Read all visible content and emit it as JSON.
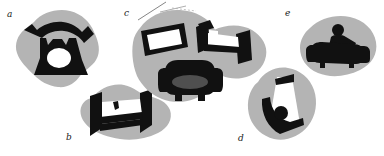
{
  "figure": {
    "type": "line-drawing-silhouette-diagram",
    "background_color": "#ffffff",
    "blob_color": "#b4b4b4",
    "silhouette_color": "#111111",
    "cushion_color": "#4f4f4f",
    "hole_color": "#ffffff",
    "width": 384,
    "height": 156
  },
  "panels": [
    {
      "id": "a",
      "label": "a",
      "label_x": 7,
      "label_y": 10,
      "object": "rotary-telephone",
      "object_count": 1,
      "has_blob": true
    },
    {
      "id": "b",
      "label": "b",
      "label_x": 66,
      "label_y": 133,
      "object": "bed",
      "object_count": 1,
      "has_blob": true
    },
    {
      "id": "c",
      "label": "c",
      "label_x": 124,
      "label_y": 9,
      "object": "picture-frame-bed-armchair-group",
      "object_count": 3,
      "has_blob": true
    },
    {
      "id": "d",
      "label": "d",
      "label_x": 238,
      "label_y": 134,
      "object": "chair-with-ball",
      "object_count": 1,
      "has_blob": true
    },
    {
      "id": "e",
      "label": "e",
      "label_x": 285,
      "label_y": 9,
      "object": "sofa-with-ball",
      "object_count": 1,
      "has_blob": true
    }
  ]
}
